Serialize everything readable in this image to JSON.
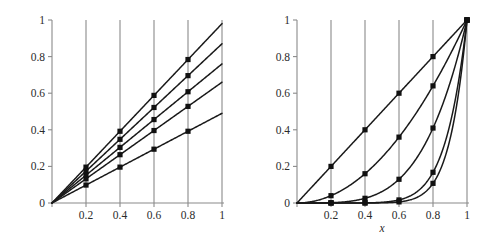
{
  "figure": {
    "background_color": "#ffffff",
    "ink_color": "#1a1a1a",
    "axis_color": "#8a8a8a"
  },
  "chart_data": [
    {
      "type": "line",
      "panel": "left",
      "title": "",
      "xlabel": "",
      "ylabel": "",
      "xlim": [
        0,
        1
      ],
      "ylim": [
        0,
        1
      ],
      "grid": true,
      "grid_orientation": "vertical",
      "legend": "none",
      "xticks": [
        0,
        0.2,
        0.4,
        0.6,
        0.8,
        1
      ],
      "xtick_labels": [
        "0",
        "0.2",
        "0.4",
        "0.6",
        "0.8",
        "1"
      ],
      "yticks": [
        0,
        0.2,
        0.4,
        0.6,
        0.8,
        1
      ],
      "ytick_labels": [
        "0",
        "0.2",
        "0.4",
        "0.6",
        "0.8",
        "1"
      ],
      "marker": "filled-square",
      "marker_x": [
        0.2,
        0.4,
        0.6,
        0.8
      ],
      "series": [
        {
          "name": "slope-0.98",
          "slope": 0.98,
          "x": [
            0,
            0.2,
            0.4,
            0.6,
            0.8,
            1
          ],
          "values": [
            0,
            0.196,
            0.392,
            0.588,
            0.784,
            0.98
          ]
        },
        {
          "name": "slope-0.87",
          "slope": 0.87,
          "x": [
            0,
            0.2,
            0.4,
            0.6,
            0.8,
            1
          ],
          "values": [
            0,
            0.174,
            0.348,
            0.522,
            0.696,
            0.87
          ]
        },
        {
          "name": "slope-0.76",
          "slope": 0.76,
          "x": [
            0,
            0.2,
            0.4,
            0.6,
            0.8,
            1
          ],
          "values": [
            0,
            0.152,
            0.304,
            0.456,
            0.608,
            0.76
          ]
        },
        {
          "name": "slope-0.66",
          "slope": 0.66,
          "x": [
            0,
            0.2,
            0.4,
            0.6,
            0.8,
            1
          ],
          "values": [
            0,
            0.132,
            0.264,
            0.396,
            0.528,
            0.66
          ]
        },
        {
          "name": "slope-0.49",
          "slope": 0.49,
          "x": [
            0,
            0.2,
            0.4,
            0.6,
            0.8,
            1
          ],
          "values": [
            0,
            0.098,
            0.196,
            0.294,
            0.392,
            0.49
          ]
        }
      ]
    },
    {
      "type": "line",
      "panel": "right",
      "title": "",
      "xlabel": "x",
      "ylabel": "",
      "xlim": [
        0,
        1
      ],
      "ylim": [
        0,
        1
      ],
      "grid": true,
      "grid_orientation": "vertical",
      "legend": "none",
      "xticks": [
        0,
        0.2,
        0.4,
        0.6,
        0.8,
        1
      ],
      "xtick_labels": [
        "0",
        "0.2",
        "0.4",
        "0.6",
        "0.8",
        "1"
      ],
      "yticks": [
        0,
        0.2,
        0.4,
        0.6,
        0.8,
        1
      ],
      "ytick_labels": [
        "0",
        "0.2",
        "0.4",
        "0.6",
        "0.8",
        "1"
      ],
      "marker": "filled-square",
      "marker_x": [
        0.2,
        0.4,
        0.6,
        0.8,
        1
      ],
      "series": [
        {
          "name": "power-1",
          "exponent": 1,
          "x": [
            0,
            0.2,
            0.4,
            0.6,
            0.8,
            1
          ],
          "values": [
            0,
            0.2,
            0.4,
            0.6,
            0.8,
            1
          ]
        },
        {
          "name": "power-2",
          "exponent": 2,
          "x": [
            0,
            0.2,
            0.4,
            0.6,
            0.8,
            1
          ],
          "values": [
            0,
            0.04,
            0.16,
            0.36,
            0.64,
            1
          ]
        },
        {
          "name": "power-4",
          "exponent": 4,
          "x": [
            0,
            0.2,
            0.4,
            0.6,
            0.8,
            1
          ],
          "values": [
            0,
            0.0016,
            0.0256,
            0.1296,
            0.4096,
            1
          ]
        },
        {
          "name": "power-8",
          "exponent": 8,
          "x": [
            0,
            0.2,
            0.4,
            0.6,
            0.8,
            1
          ],
          "values": [
            0,
            2.6e-06,
            0.00066,
            0.0168,
            0.1678,
            1
          ]
        },
        {
          "name": "power-10",
          "exponent": 10,
          "x": [
            0,
            0.2,
            0.4,
            0.6,
            0.8,
            1
          ],
          "values": [
            0,
            1e-07,
            0.0001049,
            0.0060466,
            0.1073742,
            1
          ]
        }
      ]
    }
  ]
}
